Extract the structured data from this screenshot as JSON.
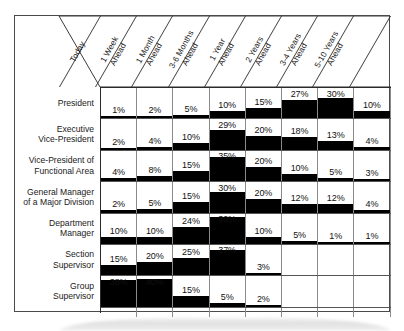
{
  "figure": {
    "columns": [
      "Today",
      "1 Week\nAhead",
      "1 Month\nAhead",
      "3-6 Months\nAhead",
      "1 Year\nAhead",
      "2 Years\nAhead",
      "3-4 Years\nAhead",
      "5-10 Years\nAhead"
    ],
    "rows": [
      "President",
      "Executive\nVice-President",
      "Vice-President of\nFunctional Area",
      "General Manager\nof a Major Division",
      "Department\nManager",
      "Section\nSupervisor",
      "Group\nSupervisor"
    ]
  },
  "chart_data": {
    "type": "bar",
    "xlabel": "",
    "ylabel": "",
    "ylim": [
      0,
      40
    ],
    "grid": true,
    "legend": "none",
    "categories": [
      "Today",
      "1 Week Ahead",
      "1 Month Ahead",
      "3-6 Months Ahead",
      "1 Year Ahead",
      "2 Years Ahead",
      "3-4 Years Ahead",
      "5-10 Years Ahead"
    ],
    "series": [
      {
        "name": "President",
        "values": [
          1,
          2,
          5,
          10,
          15,
          27,
          30,
          10
        ]
      },
      {
        "name": "Executive Vice-President",
        "values": [
          2,
          4,
          10,
          29,
          20,
          18,
          13,
          4
        ]
      },
      {
        "name": "Vice-President of Functional Area",
        "values": [
          4,
          8,
          15,
          35,
          20,
          10,
          5,
          3
        ]
      },
      {
        "name": "General Manager of a Major Division",
        "values": [
          2,
          5,
          15,
          30,
          20,
          12,
          12,
          4
        ]
      },
      {
        "name": "Department Manager",
        "values": [
          10,
          10,
          24,
          39,
          10,
          5,
          1,
          1
        ]
      },
      {
        "name": "Section Supervisor",
        "values": [
          15,
          20,
          25,
          37,
          3,
          null,
          null,
          null
        ]
      },
      {
        "name": "Group Supervisor",
        "values": [
          38,
          40,
          15,
          5,
          2,
          null,
          null,
          null
        ]
      }
    ],
    "value_labels": [
      [
        "1%",
        "2%",
        "5%",
        "10%",
        "15%",
        "27%",
        "30%",
        "10%"
      ],
      [
        "2%",
        "4%",
        "10%",
        "29%",
        "20%",
        "18%",
        "13%",
        "4%"
      ],
      [
        "4%",
        "8%",
        "15%",
        "35%",
        "20%",
        "10%",
        "5%",
        "3%"
      ],
      [
        "2%",
        "5%",
        "15%",
        "30%",
        "20%",
        "12%",
        "12%",
        "4%"
      ],
      [
        "10%",
        "10%",
        "24%",
        "39%",
        "10%",
        "5%",
        "1%",
        "1%"
      ],
      [
        "15%",
        "20%",
        "25%",
        "37%",
        "3%",
        "",
        "",
        ""
      ],
      [
        "38%",
        "40%",
        "15%",
        "5%",
        "2%",
        "",
        "",
        ""
      ]
    ],
    "colors": {
      "bar": "#000000",
      "grid": "#8a8a8a",
      "border": "#2a2a2a",
      "text": "#1a1a1a"
    }
  }
}
